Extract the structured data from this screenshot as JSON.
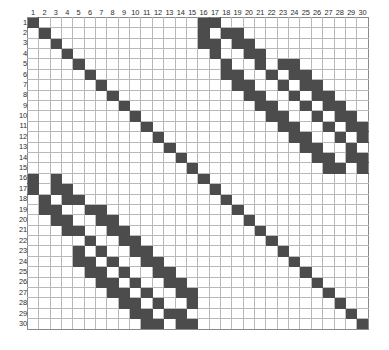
{
  "chart_data": {
    "type": "heatmap",
    "title": "",
    "subtitle": "",
    "xlabel": "",
    "ylabel": "",
    "grid": true,
    "legend": null,
    "n_rows": 30,
    "n_cols": 30,
    "value_labels": {
      "filled": "1",
      "empty": "0"
    },
    "colors": {
      "filled": "#4c4c4c",
      "empty": "#ffffff",
      "gridline": "#b9b9b9",
      "border": "#8a8a8a",
      "label_text": "#2b2b2b",
      "background": "#ffffff"
    },
    "x_tick_labels": [
      "1",
      "2",
      "3",
      "4",
      "5",
      "6",
      "7",
      "8",
      "9",
      "10",
      "11",
      "12",
      "13",
      "14",
      "15",
      "16",
      "17",
      "18",
      "19",
      "20",
      "21",
      "22",
      "23",
      "24",
      "25",
      "26",
      "27",
      "28",
      "29",
      "30"
    ],
    "y_tick_labels": [
      "1",
      "2",
      "3",
      "4",
      "5",
      "6",
      "7",
      "8",
      "9",
      "10",
      "11",
      "12",
      "13",
      "14",
      "15",
      "16",
      "17",
      "18",
      "19",
      "20",
      "21",
      "22",
      "23",
      "24",
      "25",
      "26",
      "27",
      "28",
      "29",
      "30"
    ],
    "matrix": [
      [
        1,
        0,
        0,
        0,
        0,
        0,
        0,
        0,
        0,
        0,
        0,
        0,
        0,
        0,
        0,
        1,
        1,
        0,
        0,
        0,
        0,
        0,
        0,
        0,
        0,
        0,
        0,
        0,
        0,
        0
      ],
      [
        0,
        1,
        0,
        0,
        0,
        0,
        0,
        0,
        0,
        0,
        0,
        0,
        0,
        0,
        0,
        1,
        0,
        1,
        1,
        0,
        0,
        0,
        0,
        0,
        0,
        0,
        0,
        0,
        0,
        0
      ],
      [
        0,
        0,
        1,
        0,
        0,
        0,
        0,
        0,
        0,
        0,
        0,
        0,
        0,
        0,
        0,
        1,
        1,
        0,
        1,
        1,
        0,
        0,
        0,
        0,
        0,
        0,
        0,
        0,
        0,
        0
      ],
      [
        0,
        0,
        0,
        1,
        0,
        0,
        0,
        0,
        0,
        0,
        0,
        0,
        0,
        0,
        0,
        0,
        1,
        0,
        0,
        1,
        1,
        0,
        0,
        0,
        0,
        0,
        0,
        0,
        0,
        0
      ],
      [
        0,
        0,
        0,
        0,
        1,
        0,
        0,
        0,
        0,
        0,
        0,
        0,
        0,
        0,
        0,
        0,
        0,
        1,
        0,
        0,
        1,
        0,
        1,
        1,
        0,
        0,
        0,
        0,
        0,
        0
      ],
      [
        0,
        0,
        0,
        0,
        0,
        1,
        0,
        0,
        0,
        0,
        0,
        0,
        0,
        0,
        0,
        0,
        0,
        1,
        1,
        0,
        0,
        1,
        0,
        1,
        1,
        0,
        0,
        0,
        0,
        0
      ],
      [
        0,
        0,
        0,
        0,
        0,
        0,
        1,
        0,
        0,
        0,
        0,
        0,
        0,
        0,
        0,
        0,
        0,
        0,
        1,
        1,
        0,
        0,
        1,
        0,
        1,
        1,
        0,
        0,
        0,
        0
      ],
      [
        0,
        0,
        0,
        0,
        0,
        0,
        0,
        1,
        0,
        0,
        0,
        0,
        0,
        0,
        0,
        0,
        0,
        0,
        0,
        1,
        1,
        0,
        0,
        1,
        0,
        1,
        1,
        0,
        0,
        0
      ],
      [
        0,
        0,
        0,
        0,
        0,
        0,
        0,
        0,
        1,
        0,
        0,
        0,
        0,
        0,
        0,
        0,
        0,
        0,
        0,
        0,
        1,
        1,
        0,
        0,
        1,
        0,
        1,
        1,
        0,
        0
      ],
      [
        0,
        0,
        0,
        0,
        0,
        0,
        0,
        0,
        0,
        1,
        0,
        0,
        0,
        0,
        0,
        0,
        0,
        0,
        0,
        0,
        0,
        1,
        1,
        0,
        0,
        1,
        0,
        1,
        1,
        0
      ],
      [
        0,
        0,
        0,
        0,
        0,
        0,
        0,
        0,
        0,
        0,
        1,
        0,
        0,
        0,
        0,
        0,
        0,
        0,
        0,
        0,
        0,
        0,
        1,
        1,
        0,
        0,
        1,
        0,
        1,
        1
      ],
      [
        0,
        0,
        0,
        0,
        0,
        0,
        0,
        0,
        0,
        0,
        0,
        1,
        0,
        0,
        0,
        0,
        0,
        0,
        0,
        0,
        0,
        0,
        0,
        1,
        1,
        0,
        0,
        1,
        0,
        1
      ],
      [
        0,
        0,
        0,
        0,
        0,
        0,
        0,
        0,
        0,
        0,
        0,
        0,
        1,
        0,
        0,
        0,
        0,
        0,
        0,
        0,
        0,
        0,
        0,
        0,
        1,
        1,
        0,
        0,
        1,
        0
      ],
      [
        0,
        0,
        0,
        0,
        0,
        0,
        0,
        0,
        0,
        0,
        0,
        0,
        0,
        1,
        0,
        0,
        0,
        0,
        0,
        0,
        0,
        0,
        0,
        0,
        0,
        1,
        1,
        0,
        1,
        1
      ],
      [
        0,
        0,
        0,
        0,
        0,
        0,
        0,
        0,
        0,
        0,
        0,
        0,
        0,
        0,
        1,
        0,
        0,
        0,
        0,
        0,
        0,
        0,
        0,
        0,
        0,
        0,
        1,
        1,
        0,
        1
      ],
      [
        1,
        0,
        1,
        0,
        0,
        0,
        0,
        0,
        0,
        0,
        0,
        0,
        0,
        0,
        0,
        1,
        0,
        0,
        0,
        0,
        0,
        0,
        0,
        0,
        0,
        0,
        0,
        0,
        0,
        0
      ],
      [
        1,
        0,
        1,
        1,
        0,
        0,
        0,
        0,
        0,
        0,
        0,
        0,
        0,
        0,
        0,
        0,
        1,
        0,
        0,
        0,
        0,
        0,
        0,
        0,
        0,
        0,
        0,
        0,
        0,
        0
      ],
      [
        0,
        1,
        0,
        1,
        1,
        0,
        0,
        0,
        0,
        0,
        0,
        0,
        0,
        0,
        0,
        0,
        0,
        1,
        0,
        0,
        0,
        0,
        0,
        0,
        0,
        0,
        0,
        0,
        0,
        0
      ],
      [
        0,
        1,
        1,
        0,
        0,
        1,
        1,
        0,
        0,
        0,
        0,
        0,
        0,
        0,
        0,
        0,
        0,
        0,
        1,
        0,
        0,
        0,
        0,
        0,
        0,
        0,
        0,
        0,
        0,
        0
      ],
      [
        0,
        0,
        1,
        1,
        0,
        0,
        1,
        1,
        0,
        0,
        0,
        0,
        0,
        0,
        0,
        0,
        0,
        0,
        0,
        1,
        0,
        0,
        0,
        0,
        0,
        0,
        0,
        0,
        0,
        0
      ],
      [
        0,
        0,
        0,
        1,
        1,
        0,
        0,
        1,
        1,
        0,
        0,
        0,
        0,
        0,
        0,
        0,
        0,
        0,
        0,
        0,
        1,
        0,
        0,
        0,
        0,
        0,
        0,
        0,
        0,
        0
      ],
      [
        0,
        0,
        0,
        0,
        0,
        1,
        0,
        0,
        1,
        1,
        0,
        0,
        0,
        0,
        0,
        0,
        0,
        0,
        0,
        0,
        0,
        1,
        0,
        0,
        0,
        0,
        0,
        0,
        0,
        0
      ],
      [
        0,
        0,
        0,
        0,
        1,
        0,
        1,
        0,
        0,
        1,
        1,
        0,
        0,
        0,
        0,
        0,
        0,
        0,
        0,
        0,
        0,
        0,
        1,
        0,
        0,
        0,
        0,
        0,
        0,
        0
      ],
      [
        0,
        0,
        0,
        0,
        1,
        1,
        0,
        1,
        0,
        0,
        1,
        1,
        0,
        0,
        0,
        0,
        0,
        0,
        0,
        0,
        0,
        0,
        0,
        1,
        0,
        0,
        0,
        0,
        0,
        0
      ],
      [
        0,
        0,
        0,
        0,
        0,
        1,
        1,
        0,
        1,
        0,
        0,
        1,
        1,
        0,
        0,
        0,
        0,
        0,
        0,
        0,
        0,
        0,
        0,
        0,
        1,
        0,
        0,
        0,
        0,
        0
      ],
      [
        0,
        0,
        0,
        0,
        0,
        0,
        1,
        1,
        0,
        1,
        0,
        0,
        1,
        1,
        0,
        0,
        0,
        0,
        0,
        0,
        0,
        0,
        0,
        0,
        0,
        1,
        0,
        0,
        0,
        0
      ],
      [
        0,
        0,
        0,
        0,
        0,
        0,
        0,
        1,
        1,
        0,
        1,
        0,
        0,
        1,
        1,
        0,
        0,
        0,
        0,
        0,
        0,
        0,
        0,
        0,
        0,
        0,
        1,
        0,
        0,
        0
      ],
      [
        0,
        0,
        0,
        0,
        0,
        0,
        0,
        0,
        1,
        1,
        0,
        1,
        0,
        0,
        1,
        0,
        0,
        0,
        0,
        0,
        0,
        0,
        0,
        0,
        0,
        0,
        0,
        1,
        0,
        0
      ],
      [
        0,
        0,
        0,
        0,
        0,
        0,
        0,
        0,
        0,
        1,
        1,
        0,
        1,
        1,
        0,
        0,
        0,
        0,
        0,
        0,
        0,
        0,
        0,
        0,
        0,
        0,
        0,
        0,
        1,
        0
      ],
      [
        0,
        0,
        0,
        0,
        0,
        0,
        0,
        0,
        0,
        0,
        1,
        1,
        0,
        1,
        1,
        0,
        0,
        0,
        0,
        0,
        0,
        0,
        0,
        0,
        0,
        0,
        0,
        0,
        0,
        1
      ]
    ]
  }
}
